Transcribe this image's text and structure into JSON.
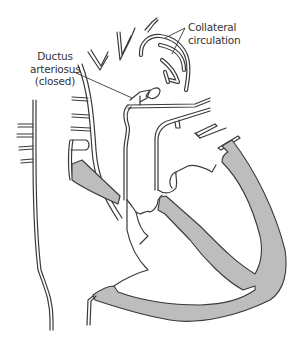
{
  "diagram": {
    "labels": {
      "collateral": {
        "line1": "Collateral",
        "line2": "circulation"
      },
      "ductus": {
        "line1": "Ductus",
        "line2": "arteriosus",
        "line3": "(closed)"
      }
    },
    "colors": {
      "outline": "#3a3a3a",
      "muscle_fill": "#bdbdbd",
      "background": "#ffffff",
      "label_text": "#333333"
    }
  }
}
